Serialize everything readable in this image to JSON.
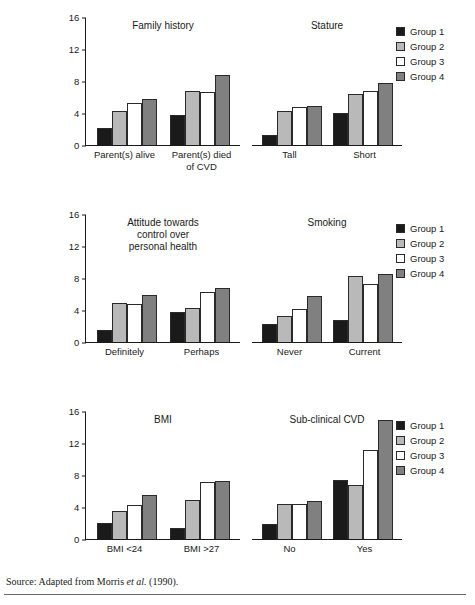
{
  "legend": {
    "items": [
      {
        "label": "Group 1",
        "color": "#1a1a1a"
      },
      {
        "label": "Group 2",
        "color": "#b9b9b9"
      },
      {
        "label": "Group 3",
        "color": "#ffffff"
      },
      {
        "label": "Group 4",
        "color": "#808080"
      }
    ]
  },
  "axis": {
    "ticks": [
      "16",
      "12",
      "8",
      "4",
      "0"
    ],
    "min": 0,
    "max": 16
  },
  "footer": {
    "source_prefix": "Source: Adapted from Morris ",
    "source_italic": "et al.",
    "source_suffix": " (1990)."
  },
  "panels": [
    {
      "id": "family-history",
      "title": "Family history",
      "categories": [
        "Parent(s) alive",
        "Parent(s) died\nof CVD"
      ],
      "values": [
        [
          2.1,
          4.3,
          5.2,
          5.7
        ],
        [
          3.7,
          6.8,
          6.6,
          8.8
        ]
      ]
    },
    {
      "id": "stature",
      "title": "Stature",
      "categories": [
        "Tall",
        "Short"
      ],
      "values": [
        [
          1.2,
          4.2,
          4.7,
          4.9
        ],
        [
          4.0,
          6.4,
          6.7,
          7.7
        ]
      ]
    },
    {
      "id": "attitude",
      "title": "Attitude towards\ncontrol over\npersonal health",
      "categories": [
        "Definitely",
        "Perhaps"
      ],
      "values": [
        [
          1.5,
          4.9,
          4.8,
          5.9
        ],
        [
          3.7,
          4.3,
          6.3,
          6.7
        ]
      ]
    },
    {
      "id": "smoking",
      "title": "Smoking",
      "categories": [
        "Never",
        "Current"
      ],
      "values": [
        [
          2.2,
          3.2,
          4.1,
          5.7
        ],
        [
          2.8,
          8.2,
          7.2,
          8.5
        ]
      ]
    },
    {
      "id": "bmi",
      "title": "BMI",
      "categories": [
        "BMI <24",
        "BMI >27"
      ],
      "values": [
        [
          2.0,
          3.5,
          4.3,
          5.5
        ],
        [
          1.4,
          4.9,
          7.1,
          7.3
        ]
      ]
    },
    {
      "id": "sub-clinical-cvd",
      "title": "Sub-clinical CVD",
      "categories": [
        "No",
        "Yes"
      ],
      "values": [
        [
          1.9,
          4.4,
          4.4,
          4.8
        ],
        [
          7.4,
          6.7,
          11.1,
          14.9
        ]
      ]
    }
  ],
  "chart_data": {
    "type": "bar",
    "title": "",
    "subtitle": "",
    "xlabel": "",
    "ylabel": "",
    "ylim": [
      0,
      16
    ],
    "yticks": [
      0,
      4,
      8,
      12,
      16
    ],
    "grid": false,
    "legend_position": "right",
    "series_names": [
      "Group 1",
      "Group 2",
      "Group 3",
      "Group 4"
    ],
    "series_colors": [
      "#1a1a1a",
      "#b9b9b9",
      "#ffffff",
      "#808080"
    ],
    "panels": [
      {
        "title": "Family history",
        "categories": [
          "Parent(s) alive",
          "Parent(s) died of CVD"
        ],
        "series": [
          {
            "name": "Group 1",
            "values": [
              2.1,
              3.7
            ]
          },
          {
            "name": "Group 2",
            "values": [
              4.3,
              6.8
            ]
          },
          {
            "name": "Group 3",
            "values": [
              5.2,
              6.6
            ]
          },
          {
            "name": "Group 4",
            "values": [
              5.7,
              8.8
            ]
          }
        ]
      },
      {
        "title": "Stature",
        "categories": [
          "Tall",
          "Short"
        ],
        "series": [
          {
            "name": "Group 1",
            "values": [
              1.2,
              4.0
            ]
          },
          {
            "name": "Group 2",
            "values": [
              4.2,
              6.4
            ]
          },
          {
            "name": "Group 3",
            "values": [
              4.7,
              6.7
            ]
          },
          {
            "name": "Group 4",
            "values": [
              4.9,
              7.7
            ]
          }
        ]
      },
      {
        "title": "Attitude towards control over personal health",
        "categories": [
          "Definitely",
          "Perhaps"
        ],
        "series": [
          {
            "name": "Group 1",
            "values": [
              1.5,
              3.7
            ]
          },
          {
            "name": "Group 2",
            "values": [
              4.9,
              4.3
            ]
          },
          {
            "name": "Group 3",
            "values": [
              4.8,
              6.3
            ]
          },
          {
            "name": "Group 4",
            "values": [
              5.9,
              6.7
            ]
          }
        ]
      },
      {
        "title": "Smoking",
        "categories": [
          "Never",
          "Current"
        ],
        "series": [
          {
            "name": "Group 1",
            "values": [
              2.2,
              2.8
            ]
          },
          {
            "name": "Group 2",
            "values": [
              3.2,
              8.2
            ]
          },
          {
            "name": "Group 3",
            "values": [
              4.1,
              7.2
            ]
          },
          {
            "name": "Group 4",
            "values": [
              5.7,
              8.5
            ]
          }
        ]
      },
      {
        "title": "BMI",
        "categories": [
          "BMI <24",
          "BMI >27"
        ],
        "series": [
          {
            "name": "Group 1",
            "values": [
              2.0,
              1.4
            ]
          },
          {
            "name": "Group 2",
            "values": [
              3.5,
              4.9
            ]
          },
          {
            "name": "Group 3",
            "values": [
              4.3,
              7.1
            ]
          },
          {
            "name": "Group 4",
            "values": [
              5.5,
              7.3
            ]
          }
        ]
      },
      {
        "title": "Sub-clinical CVD",
        "categories": [
          "No",
          "Yes"
        ],
        "series": [
          {
            "name": "Group 1",
            "values": [
              1.9,
              7.4
            ]
          },
          {
            "name": "Group 2",
            "values": [
              4.4,
              6.7
            ]
          },
          {
            "name": "Group 3",
            "values": [
              4.4,
              11.1
            ]
          },
          {
            "name": "Group 4",
            "values": [
              4.8,
              14.9
            ]
          }
        ]
      }
    ]
  }
}
